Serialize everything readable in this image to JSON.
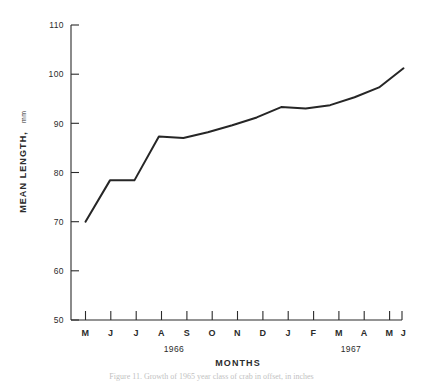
{
  "figure": {
    "caption": "Figure 11. Growth of 1965 year class of crab in offset, in inches"
  },
  "axes": {
    "y_title": "MEAN LENGTH,",
    "y_unit": "mm",
    "x_title": "MONTHS",
    "y_ticks": [
      "110",
      "100",
      "90",
      "80",
      "70",
      "60",
      "50"
    ],
    "year_groups": [
      {
        "label": "1966"
      },
      {
        "label": "1967"
      }
    ]
  },
  "chart_data": {
    "type": "line",
    "title": "",
    "subtitle": "",
    "xlabel": "MONTHS",
    "ylabel": "MEAN LENGTH, mm",
    "ylim": [
      50,
      110
    ],
    "yticks": [
      50,
      60,
      70,
      80,
      90,
      100,
      110
    ],
    "grid": false,
    "legend": "none",
    "categories": [
      "M",
      "J",
      "J",
      "A",
      "S",
      "O",
      "N",
      "D",
      "J",
      "F",
      "M",
      "A",
      "M",
      "J"
    ],
    "x_groups": [
      "1966",
      "1966",
      "1966",
      "1966",
      "1966",
      "1966",
      "1966",
      "1966",
      "1967",
      "1967",
      "1967",
      "1967",
      "1967",
      "1967"
    ],
    "values": [
      70.0,
      78.4,
      78.4,
      87.3,
      87.0,
      88.2,
      89.6,
      91.2,
      93.3,
      93.0,
      93.7,
      95.3,
      97.3,
      101.2
    ],
    "series": [
      {
        "name": "Mean length",
        "values": [
          70.0,
          78.4,
          78.4,
          87.3,
          87.0,
          88.2,
          89.6,
          91.2,
          93.3,
          93.0,
          93.7,
          95.3,
          97.3,
          101.2
        ],
        "color": "#262626"
      }
    ]
  }
}
